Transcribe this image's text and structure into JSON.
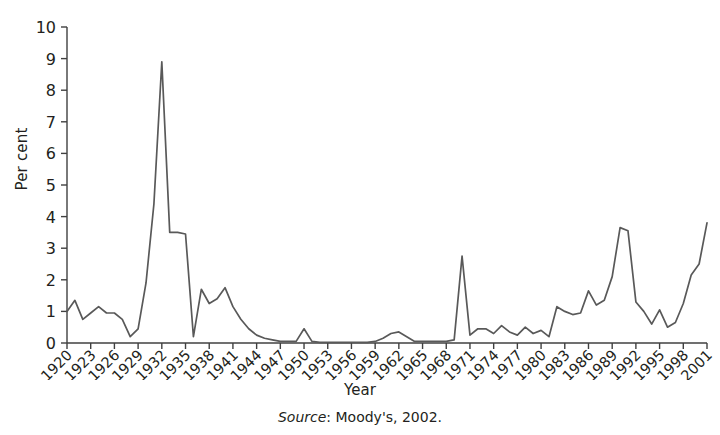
{
  "chart_data": {
    "type": "line",
    "title": "",
    "xlabel": "Year",
    "ylabel": "Per cent",
    "xlim": [
      1920,
      2001
    ],
    "ylim": [
      0,
      10
    ],
    "ytick_labels": [
      "0",
      "1",
      "2",
      "3",
      "4",
      "5",
      "6",
      "7",
      "8",
      "9",
      "10"
    ],
    "ytick_values": [
      0,
      1,
      2,
      3,
      4,
      5,
      6,
      7,
      8,
      9,
      10
    ],
    "xtick_labels": [
      "1920",
      "1923",
      "1926",
      "1929",
      "1932",
      "1935",
      "1938",
      "1941",
      "1944",
      "1947",
      "1950",
      "1953",
      "1956",
      "1959",
      "1962",
      "1965",
      "1968",
      "1971",
      "1974",
      "1977",
      "1980",
      "1983",
      "1986",
      "1989",
      "1992",
      "1995",
      "1998",
      "2001"
    ],
    "xtick_values": [
      1920,
      1923,
      1926,
      1929,
      1932,
      1935,
      1938,
      1941,
      1944,
      1947,
      1950,
      1953,
      1956,
      1959,
      1962,
      1965,
      1968,
      1971,
      1974,
      1977,
      1980,
      1983,
      1986,
      1989,
      1992,
      1995,
      1998,
      2001
    ],
    "grid": false,
    "legend": null,
    "line_color": "#595959",
    "line_width": 1.7,
    "x": [
      1920,
      1921,
      1922,
      1923,
      1924,
      1925,
      1926,
      1927,
      1928,
      1929,
      1930,
      1931,
      1932,
      1933,
      1934,
      1935,
      1936,
      1937,
      1938,
      1939,
      1940,
      1941,
      1942,
      1943,
      1944,
      1945,
      1946,
      1947,
      1948,
      1949,
      1950,
      1951,
      1952,
      1953,
      1954,
      1955,
      1956,
      1957,
      1958,
      1959,
      1960,
      1961,
      1962,
      1963,
      1964,
      1965,
      1966,
      1967,
      1968,
      1969,
      1970,
      1971,
      1972,
      1973,
      1974,
      1975,
      1976,
      1977,
      1978,
      1979,
      1980,
      1981,
      1982,
      1983,
      1984,
      1985,
      1986,
      1987,
      1988,
      1989,
      1990,
      1991,
      1992,
      1993,
      1994,
      1995,
      1996,
      1997,
      1998,
      1999,
      2000,
      2001
    ],
    "y": [
      1.0,
      1.35,
      0.75,
      0.95,
      1.15,
      0.95,
      0.95,
      0.75,
      0.2,
      0.45,
      1.9,
      4.4,
      8.9,
      3.5,
      3.5,
      3.45,
      0.2,
      1.7,
      1.25,
      1.4,
      1.75,
      1.15,
      0.75,
      0.45,
      0.25,
      0.15,
      0.1,
      0.05,
      0.05,
      0.05,
      0.45,
      0.05,
      0.02,
      0.02,
      0.02,
      0.02,
      0.02,
      0.02,
      0.02,
      0.05,
      0.15,
      0.3,
      0.35,
      0.2,
      0.05,
      0.05,
      0.05,
      0.05,
      0.05,
      0.1,
      2.75,
      0.25,
      0.45,
      0.45,
      0.3,
      0.55,
      0.35,
      0.25,
      0.5,
      0.3,
      0.4,
      0.2,
      1.15,
      1.0,
      0.9,
      0.95,
      1.65,
      1.2,
      1.35,
      2.1,
      3.65,
      3.55,
      1.3,
      1.0,
      0.6,
      1.05,
      0.5,
      0.65,
      1.25,
      2.15,
      2.5,
      3.8
    ]
  },
  "caption": {
    "source_label": "Source",
    "source_text": ": Moody's, 2002."
  }
}
